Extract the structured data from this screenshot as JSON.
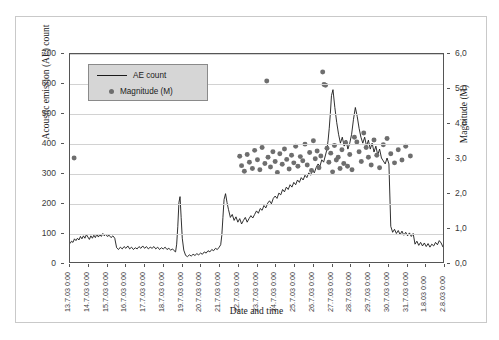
{
  "chart_data": {
    "type": "line",
    "title": "",
    "xlabel": "Date and time",
    "ylabel": "Acoustic emission (AE) count",
    "y2label": "Magnitude (M)",
    "ylim": [
      0,
      700
    ],
    "y2lim": [
      0.0,
      6.0
    ],
    "grid": true,
    "legend_position": "top-left-inside",
    "yticks": [
      "0",
      "100",
      "200",
      "300",
      "400",
      "500",
      "600",
      "700"
    ],
    "y2ticks": [
      "0,0",
      "1,0",
      "2,0",
      "3,0",
      "4,0",
      "5,0",
      "6,0"
    ],
    "categories": [
      "13.7.03 0:00",
      "14.7.03 0:00",
      "15.7.03 0:00",
      "16.7.03 0:00",
      "17.7.03 0:00",
      "18.7.03 0:00",
      "19.7.03 0:00",
      "20.7.03 0:00",
      "21.7.03 0:00",
      "22.7.03 0:00",
      "23.7.03 0:00",
      "24.7.03 0:00",
      "25.7.03 0:00",
      "26.7.03 0:00",
      "27.7.03 0:00",
      "28.7.03 0:00",
      "29.7.03 0:00",
      "30.7.03 0:00",
      "31.7.03 0:00",
      "1.8.03 0:00",
      "2.8.03 0:00"
    ],
    "series": [
      {
        "name": "AE count",
        "type": "line",
        "axis": "left",
        "color": "#1a1a1a",
        "x": [
          0.0,
          0.08,
          0.16,
          0.24,
          0.32,
          0.4,
          0.48,
          0.56,
          0.64,
          0.72,
          0.8,
          0.88,
          0.96,
          1.04,
          1.12,
          1.2,
          1.28,
          1.36,
          1.44,
          1.52,
          1.6,
          1.68,
          1.76,
          1.84,
          1.92,
          2.0,
          2.1,
          2.2,
          2.3,
          2.4,
          2.5,
          2.6,
          2.7,
          2.8,
          2.9,
          3.0,
          3.1,
          3.2,
          3.3,
          3.4,
          3.5,
          3.6,
          3.7,
          3.8,
          3.9,
          4.0,
          4.1,
          4.2,
          4.3,
          4.4,
          4.5,
          4.6,
          4.7,
          4.8,
          4.9,
          5.0,
          5.1,
          5.2,
          5.3,
          5.4,
          5.5,
          5.58,
          5.66,
          5.72,
          5.78,
          5.84,
          5.9,
          5.96,
          6.02,
          6.1,
          6.2,
          6.3,
          6.4,
          6.5,
          6.6,
          6.7,
          6.8,
          6.9,
          7.0,
          7.1,
          7.2,
          7.3,
          7.4,
          7.5,
          7.6,
          7.7,
          7.8,
          7.9,
          8.0,
          8.08,
          8.14,
          8.2,
          8.26,
          8.34,
          8.42,
          8.5,
          8.6,
          8.7,
          8.8,
          8.9,
          9.0,
          9.1,
          9.2,
          9.3,
          9.4,
          9.5,
          9.6,
          9.7,
          9.8,
          9.9,
          10.0,
          10.1,
          10.2,
          10.3,
          10.4,
          10.5,
          10.6,
          10.7,
          10.8,
          10.9,
          11.0,
          11.1,
          11.2,
          11.3,
          11.4,
          11.5,
          11.6,
          11.7,
          11.8,
          11.9,
          12.0,
          12.1,
          12.2,
          12.3,
          12.4,
          12.5,
          12.6,
          12.7,
          12.8,
          12.9,
          13.0,
          13.1,
          13.2,
          13.3,
          13.4,
          13.5,
          13.6,
          13.7,
          13.78,
          13.84,
          13.9,
          13.96,
          14.02,
          14.1,
          14.2,
          14.3,
          14.4,
          14.5,
          14.6,
          14.7,
          14.8,
          14.9,
          15.0,
          15.1,
          15.2,
          15.3,
          15.4,
          15.5,
          15.6,
          15.7,
          15.8,
          15.9,
          16.0,
          16.1,
          16.2,
          16.3,
          16.4,
          16.5,
          16.6,
          16.7,
          16.8,
          16.9,
          17.0,
          17.1,
          17.2,
          17.3,
          17.4,
          17.5,
          17.6,
          17.7,
          17.8,
          17.9,
          18.0,
          18.1,
          18.2,
          18.3,
          18.4,
          18.5,
          18.6,
          18.7,
          18.8,
          18.9,
          19.0,
          19.1,
          19.2,
          19.3,
          19.4,
          19.5,
          19.6,
          19.7,
          19.8,
          19.9,
          20.0
        ],
        "y": [
          62,
          70,
          66,
          78,
          72,
          80,
          74,
          86,
          78,
          88,
          80,
          92,
          84,
          76,
          88,
          80,
          90,
          82,
          94,
          84,
          92,
          86,
          96,
          88,
          94,
          86,
          90,
          82,
          88,
          80,
          48,
          42,
          50,
          44,
          52,
          46,
          54,
          44,
          50,
          42,
          48,
          44,
          52,
          46,
          54,
          46,
          52,
          44,
          50,
          46,
          52,
          44,
          50,
          42,
          48,
          44,
          50,
          42,
          46,
          40,
          44,
          38,
          34,
          60,
          120,
          200,
          220,
          150,
          80,
          40,
          22,
          18,
          24,
          20,
          26,
          22,
          28,
          24,
          30,
          26,
          34,
          30,
          38,
          34,
          42,
          38,
          46,
          42,
          50,
          58,
          90,
          150,
          210,
          230,
          200,
          176,
          150,
          160,
          140,
          152,
          134,
          146,
          128,
          140,
          150,
          134,
          146,
          156,
          148,
          160,
          172,
          164,
          180,
          174,
          190,
          182,
          198,
          206,
          196,
          214,
          222,
          214,
          232,
          226,
          244,
          236,
          252,
          244,
          260,
          252,
          268,
          260,
          276,
          268,
          284,
          276,
          292,
          284,
          300,
          292,
          310,
          300,
          318,
          330,
          322,
          344,
          336,
          360,
          380,
          410,
          450,
          500,
          560,
          580,
          520,
          470,
          430,
          400,
          420,
          390,
          410,
          380,
          400,
          430,
          480,
          520,
          490,
          450,
          420,
          400,
          420,
          390,
          410,
          380,
          400,
          370,
          390,
          360,
          380,
          350,
          340,
          330,
          350,
          330,
          120,
          100,
          110,
          96,
          106,
          92,
          104,
          90,
          100,
          88,
          98,
          86,
          96,
          60,
          70,
          56,
          66,
          54,
          64,
          52,
          62,
          50,
          60,
          54,
          66,
          58,
          72,
          64,
          50
        ]
      },
      {
        "name": "Magnitude (M)",
        "type": "scatter",
        "axis": "right",
        "color": "#6e6e6e",
        "points": [
          [
            0.22,
            3.0
          ],
          [
            9.1,
            3.05
          ],
          [
            9.2,
            2.78
          ],
          [
            9.35,
            2.62
          ],
          [
            9.5,
            3.1
          ],
          [
            9.62,
            2.88
          ],
          [
            9.78,
            2.7
          ],
          [
            9.9,
            3.22
          ],
          [
            10.05,
            2.95
          ],
          [
            10.18,
            2.66
          ],
          [
            10.3,
            3.3
          ],
          [
            10.45,
            2.84
          ],
          [
            10.55,
            5.22
          ],
          [
            10.62,
            3.02
          ],
          [
            10.75,
            2.74
          ],
          [
            10.88,
            3.18
          ],
          [
            11.0,
            2.9
          ],
          [
            11.12,
            2.58
          ],
          [
            11.25,
            3.12
          ],
          [
            11.38,
            2.82
          ],
          [
            11.5,
            3.26
          ],
          [
            11.62,
            2.96
          ],
          [
            11.75,
            2.68
          ],
          [
            11.88,
            3.08
          ],
          [
            12.0,
            2.86
          ],
          [
            12.1,
            3.34
          ],
          [
            12.22,
            2.76
          ],
          [
            12.35,
            3.04
          ],
          [
            12.48,
            2.92
          ],
          [
            12.6,
            3.4
          ],
          [
            12.72,
            2.8
          ],
          [
            12.85,
            3.16
          ],
          [
            12.95,
            2.64
          ],
          [
            13.05,
            3.5
          ],
          [
            13.15,
            2.98
          ],
          [
            13.25,
            3.2
          ],
          [
            13.35,
            2.72
          ],
          [
            13.45,
            3.06
          ],
          [
            13.55,
            5.48
          ],
          [
            13.62,
            5.12
          ],
          [
            13.7,
            5.1
          ],
          [
            13.78,
            3.28
          ],
          [
            13.88,
            2.88
          ],
          [
            13.98,
            3.14
          ],
          [
            14.08,
            2.6
          ],
          [
            14.18,
            3.36
          ],
          [
            14.28,
            2.94
          ],
          [
            14.38,
            3.02
          ],
          [
            14.48,
            2.7
          ],
          [
            14.58,
            3.24
          ],
          [
            14.68,
            2.84
          ],
          [
            14.78,
            3.44
          ],
          [
            14.88,
            2.76
          ],
          [
            15.0,
            3.1
          ],
          [
            15.12,
            2.66
          ],
          [
            15.25,
            3.6
          ],
          [
            15.38,
            3.46
          ],
          [
            15.5,
            3.18
          ],
          [
            15.62,
            2.9
          ],
          [
            15.75,
            3.72
          ],
          [
            15.88,
            3.3
          ],
          [
            16.0,
            3.02
          ],
          [
            16.15,
            2.8
          ],
          [
            16.3,
            3.52
          ],
          [
            16.45,
            3.08
          ],
          [
            16.6,
            2.72
          ],
          [
            16.8,
            3.38
          ],
          [
            17.0,
            3.56
          ],
          [
            17.2,
            3.12
          ],
          [
            17.4,
            2.86
          ],
          [
            17.6,
            3.24
          ],
          [
            17.8,
            2.94
          ],
          [
            18.0,
            3.34
          ],
          [
            18.25,
            3.06
          ]
        ]
      }
    ]
  },
  "legend": {
    "items": [
      {
        "label": "AE count",
        "marker": "line"
      },
      {
        "label": "Magnitude (M)",
        "marker": "dot"
      }
    ]
  }
}
